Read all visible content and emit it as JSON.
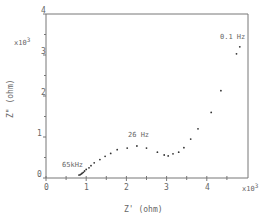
{
  "chart_data": {
    "type": "scatter",
    "title": "",
    "xlabel": "Z' (ohm)",
    "ylabel": "Z\" (ohm)",
    "x_multiplier": "x10^3",
    "y_multiplier": "x10^3",
    "xlim": [
      0,
      4.9
    ],
    "ylim": [
      0,
      4
    ],
    "x_ticks": [
      "0",
      "1",
      "2",
      "3",
      "4"
    ],
    "y_ticks": [
      "0",
      "1",
      "2",
      "3",
      "4"
    ],
    "grid": false,
    "annotations": [
      {
        "text": "65kHz",
        "x": 0.85,
        "y": 0.08
      },
      {
        "text": "26 Hz",
        "x": 2.25,
        "y": 0.78
      },
      {
        "text": "0.1 Hz",
        "x": 4.8,
        "y": 3.2
      }
    ],
    "x": [
      0.82,
      0.85,
      0.88,
      0.9,
      0.93,
      0.96,
      1.0,
      1.07,
      1.12,
      1.2,
      1.34,
      1.47,
      1.61,
      1.77,
      2.02,
      2.26,
      2.5,
      2.77,
      2.94,
      3.04,
      3.16,
      3.3,
      3.43,
      3.6,
      3.78,
      4.11,
      4.35,
      4.74,
      4.82
    ],
    "y": [
      0.07,
      0.08,
      0.1,
      0.12,
      0.14,
      0.17,
      0.21,
      0.25,
      0.3,
      0.37,
      0.45,
      0.53,
      0.6,
      0.69,
      0.73,
      0.78,
      0.73,
      0.63,
      0.56,
      0.54,
      0.59,
      0.63,
      0.74,
      0.95,
      1.2,
      1.6,
      2.13,
      3.03,
      3.2
    ]
  },
  "labels": {
    "x_unit": "x10",
    "x_exp": "3",
    "y_unit": "x10",
    "y_exp": "3",
    "xlabel": "Z'  (ohm)",
    "ylabel": "Z\"  (ohm)",
    "ann_65k": "65kHz",
    "ann_26": "26 Hz",
    "ann_01": "0.1 Hz",
    "xt0": "0",
    "xt1": "1",
    "xt2": "2",
    "xt3": "3",
    "xt4": "4",
    "yt0": "0",
    "yt1": "1",
    "yt2": "2",
    "yt3": "3",
    "yt4": "4"
  }
}
